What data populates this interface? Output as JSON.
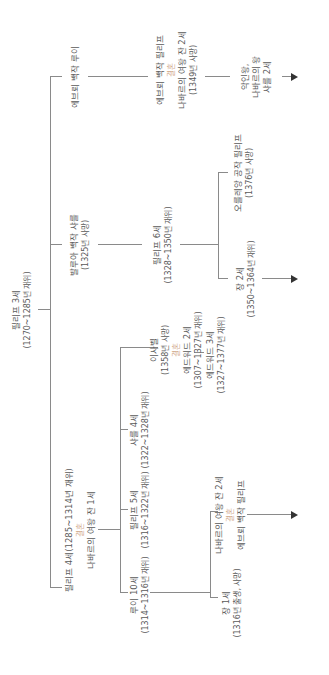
{
  "diagram": {
    "marriage_label": "결혼",
    "colors": {
      "line": "#8a8a8a",
      "text": "#5a5a5a",
      "marriage": "#d1a98a",
      "arrow": "#333333"
    },
    "nodes": {
      "philippe3": {
        "name": "필리프 3세",
        "detail": "(1270~1285년 재위)"
      },
      "louis_evreux": {
        "name": "에브뢰 백작 루이"
      },
      "charles_valois": {
        "name": "발루아 백작 샤를",
        "detail": "(1325년 사망)"
      },
      "philippe4": {
        "name": "필리프 4세(1285~1314년 재위)",
        "spouse": "나바르의 여왕 잔 1세"
      },
      "philippe_evreux": {
        "name": "에브뢰 백작 필리프",
        "spouse": "나바르의 여왕 잔 2세",
        "detail": "(1349년 사망)"
      },
      "philippe6": {
        "name": "필리프 6세",
        "detail": "(1328~1350년 재위)"
      },
      "louis10": {
        "name": "루이 10세",
        "detail": "(1314~1316년 재위)"
      },
      "philippe5": {
        "name": "필리프 5세",
        "detail": "(1316~1322년 재위)"
      },
      "charles4": {
        "name": "샤를 4세",
        "detail": "(1322~1328년 재위)"
      },
      "isabelle": {
        "name": "이사벨",
        "detail": "(1358년 사망)",
        "spouse": "에드워드 2세",
        "spouse_detail": "(1307~1327년 재위)"
      },
      "edward3": {
        "name": "에드워드 3세",
        "detail": "(1327~1377년 재위)"
      },
      "charles2_navarre": {
        "line1": "악인왕,",
        "line2": "나바르의 왕",
        "line3": "샤를 2세"
      },
      "jean2": {
        "name": "장 2세",
        "detail": "(1350~1364년 재위)"
      },
      "philippe_orleans": {
        "name": "오를레앙 공작 필리프",
        "detail": "(1376년 사망)"
      },
      "jean1": {
        "name": "장 1세",
        "detail": "(1316년 출생, 사망)"
      },
      "jeanne2": {
        "name": "나바르의 여왕 잔 2세",
        "spouse": "에브뢰 백작 필리프"
      }
    }
  }
}
